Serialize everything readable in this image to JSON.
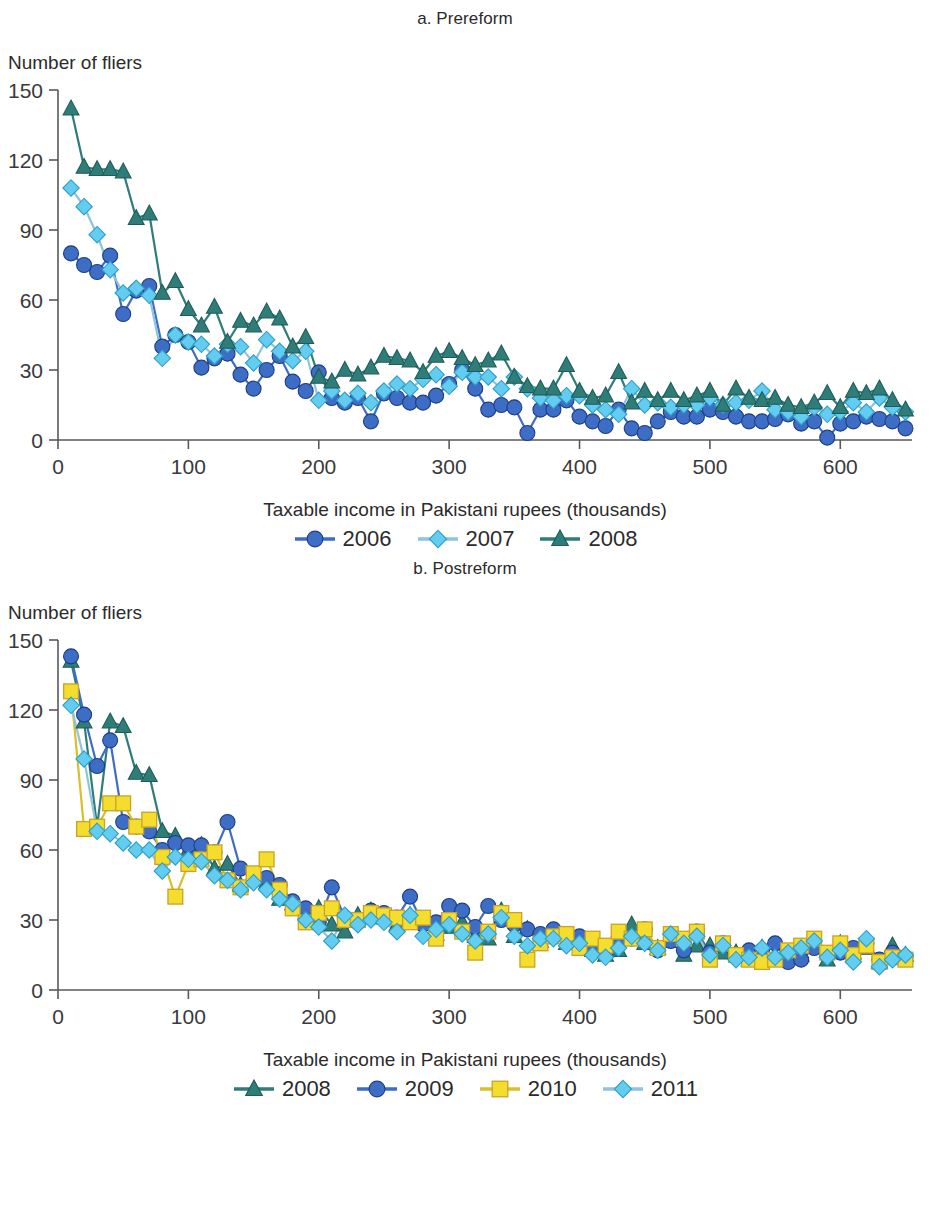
{
  "panel_a": {
    "title": "a. Prereform",
    "ylabel": "Number of fliers",
    "xlabel": "Taxable income in Pakistani rupees (thousands)",
    "legend": [
      {
        "label": "2006",
        "marker": "circle",
        "color": "#3e6dc6"
      },
      {
        "label": "2007",
        "marker": "diamond",
        "color": "#62cdf0"
      },
      {
        "label": "2008",
        "marker": "triangle",
        "color": "#2e7d78"
      }
    ]
  },
  "panel_b": {
    "title": "b. Postreform",
    "ylabel": "Number of fliers",
    "xlabel": "Taxable income in Pakistani rupees (thousands)",
    "legend": [
      {
        "label": "2008",
        "marker": "triangle",
        "color": "#2e7d78"
      },
      {
        "label": "2009",
        "marker": "circle",
        "color": "#3e6dc6"
      },
      {
        "label": "2010",
        "marker": "square",
        "color": "#f5dd2e"
      },
      {
        "label": "2011",
        "marker": "diamond",
        "color": "#62cdf0"
      }
    ]
  },
  "chart_data": [
    {
      "id": "prereform",
      "type": "line",
      "title": "a. Prereform",
      "xlabel": "Taxable income in Pakistani rupees (thousands)",
      "ylabel": "Number of fliers",
      "xlim": [
        0,
        655
      ],
      "ylim": [
        0,
        150
      ],
      "xticks": [
        0,
        100,
        200,
        300,
        400,
        500,
        600
      ],
      "yticks": [
        0,
        30,
        60,
        90,
        120,
        150
      ],
      "grid": false,
      "legend_position": "below",
      "x": [
        10,
        20,
        30,
        40,
        50,
        60,
        70,
        80,
        90,
        100,
        110,
        120,
        130,
        140,
        150,
        160,
        170,
        180,
        190,
        200,
        210,
        220,
        230,
        240,
        250,
        260,
        270,
        280,
        290,
        300,
        310,
        320,
        330,
        340,
        350,
        360,
        370,
        380,
        390,
        400,
        410,
        420,
        430,
        440,
        450,
        460,
        470,
        480,
        490,
        500,
        510,
        520,
        530,
        540,
        550,
        560,
        570,
        580,
        590,
        600,
        610,
        620,
        630,
        640,
        650
      ],
      "series": [
        {
          "name": "2006",
          "marker": "circle",
          "color": "#3e6dc6",
          "values": [
            80,
            75,
            72,
            79,
            54,
            64,
            66,
            40,
            45,
            42,
            31,
            35,
            37,
            28,
            22,
            30,
            36,
            25,
            21,
            29,
            18,
            16,
            18,
            8,
            20,
            18,
            16,
            16,
            19,
            24,
            30,
            22,
            13,
            15,
            14,
            3,
            13,
            13,
            17,
            10,
            8,
            6,
            13,
            5,
            3,
            8,
            12,
            10,
            10,
            13,
            12,
            10,
            8,
            8,
            9,
            11,
            7,
            8,
            1,
            7,
            8,
            10,
            9,
            8,
            5
          ]
        },
        {
          "name": "2007",
          "marker": "diamond",
          "color": "#62cdf0",
          "values": [
            108,
            100,
            88,
            73,
            63,
            65,
            62,
            35,
            45,
            42,
            41,
            36,
            41,
            40,
            33,
            43,
            38,
            34,
            38,
            17,
            21,
            17,
            20,
            16,
            21,
            24,
            22,
            26,
            28,
            23,
            29,
            27,
            27,
            22,
            27,
            22,
            18,
            17,
            19,
            19,
            15,
            13,
            11,
            22,
            15,
            16,
            14,
            15,
            15,
            18,
            15,
            16,
            17,
            21,
            13,
            12,
            10,
            14,
            11,
            12,
            16,
            12,
            18,
            14,
            12
          ]
        },
        {
          "name": "2008",
          "marker": "triangle",
          "color": "#2e7d78",
          "values": [
            142,
            117,
            116,
            116,
            115,
            95,
            97,
            63,
            68,
            56,
            49,
            57,
            42,
            51,
            49,
            55,
            52,
            40,
            44,
            27,
            25,
            30,
            28,
            31,
            36,
            35,
            34,
            29,
            36,
            38,
            35,
            32,
            34,
            37,
            27,
            23,
            22,
            22,
            32,
            21,
            18,
            19,
            29,
            16,
            21,
            17,
            21,
            17,
            19,
            21,
            15,
            22,
            18,
            17,
            18,
            15,
            14,
            16,
            20,
            14,
            21,
            20,
            22,
            17,
            13
          ]
        }
      ]
    },
    {
      "id": "postreform",
      "type": "line",
      "title": "b. Postreform",
      "xlabel": "Taxable income in Pakistani rupees (thousands)",
      "ylabel": "Number of fliers",
      "xlim": [
        0,
        655
      ],
      "ylim": [
        0,
        150
      ],
      "xticks": [
        0,
        100,
        200,
        300,
        400,
        500,
        600
      ],
      "yticks": [
        0,
        30,
        60,
        90,
        120,
        150
      ],
      "grid": false,
      "legend_position": "below",
      "x": [
        10,
        20,
        30,
        40,
        50,
        60,
        70,
        80,
        90,
        100,
        110,
        120,
        130,
        140,
        150,
        160,
        170,
        180,
        190,
        200,
        210,
        220,
        230,
        240,
        250,
        260,
        270,
        280,
        290,
        300,
        310,
        320,
        330,
        340,
        350,
        360,
        370,
        380,
        390,
        400,
        410,
        420,
        430,
        440,
        450,
        460,
        470,
        480,
        490,
        500,
        510,
        520,
        530,
        540,
        550,
        560,
        570,
        580,
        590,
        600,
        610,
        620,
        630,
        640,
        650
      ],
      "series": [
        {
          "name": "2008",
          "marker": "triangle",
          "color": "#2e7d78",
          "values": [
            141,
            115,
            70,
            115,
            113,
            93,
            92,
            68,
            66,
            60,
            62,
            52,
            54,
            45,
            49,
            46,
            39,
            37,
            33,
            35,
            28,
            25,
            32,
            34,
            31,
            28,
            32,
            30,
            24,
            27,
            29,
            23,
            22,
            34,
            23,
            26,
            21,
            24,
            20,
            22,
            17,
            15,
            17,
            28,
            20,
            18,
            21,
            15,
            19,
            19,
            16,
            16,
            13,
            18,
            14,
            16,
            15,
            19,
            13,
            20,
            16,
            18,
            12,
            19,
            15
          ]
        },
        {
          "name": "2009",
          "marker": "circle",
          "color": "#3e6dc6",
          "values": [
            143,
            118,
            96,
            107,
            72,
            70,
            68,
            60,
            63,
            62,
            62,
            59,
            72,
            52,
            47,
            48,
            45,
            38,
            35,
            29,
            44,
            31,
            29,
            34,
            33,
            31,
            40,
            28,
            29,
            36,
            34,
            27,
            36,
            30,
            28,
            26,
            24,
            26,
            22,
            23,
            18,
            16,
            22,
            22,
            26,
            17,
            21,
            17,
            25,
            16,
            20,
            15,
            17,
            17,
            20,
            12,
            13,
            18,
            15,
            16,
            18,
            20,
            13,
            16,
            14
          ]
        },
        {
          "name": "2010",
          "marker": "square",
          "color": "#f5dd2e",
          "values": [
            128,
            69,
            70,
            80,
            80,
            70,
            73,
            57,
            40,
            54,
            56,
            59,
            47,
            44,
            50,
            56,
            43,
            35,
            29,
            33,
            35,
            30,
            30,
            33,
            32,
            31,
            29,
            31,
            22,
            30,
            25,
            16,
            25,
            33,
            30,
            13,
            20,
            23,
            24,
            18,
            22,
            19,
            25,
            22,
            26,
            18,
            24,
            22,
            25,
            13,
            20,
            15,
            13,
            12,
            13,
            17,
            19,
            22,
            16,
            20,
            15,
            19,
            12,
            14,
            13
          ]
        },
        {
          "name": "2011",
          "marker": "diamond",
          "color": "#62cdf0",
          "values": [
            122,
            99,
            68,
            67,
            63,
            60,
            60,
            51,
            57,
            56,
            55,
            49,
            47,
            43,
            46,
            43,
            39,
            37,
            30,
            27,
            21,
            32,
            28,
            30,
            29,
            25,
            32,
            23,
            26,
            28,
            24,
            21,
            24,
            31,
            23,
            19,
            22,
            22,
            19,
            20,
            15,
            14,
            18,
            23,
            20,
            17,
            24,
            20,
            23,
            15,
            19,
            13,
            14,
            18,
            14,
            16,
            18,
            21,
            14,
            17,
            12,
            22,
            10,
            13,
            15
          ]
        }
      ]
    }
  ]
}
